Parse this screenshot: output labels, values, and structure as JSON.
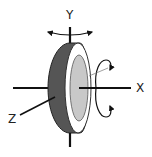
{
  "diagram": {
    "type": "3d-axes-disc-rotation",
    "labels": {
      "y_axis": "Y",
      "x_axis": "X",
      "z_axis": "Z"
    },
    "colors": {
      "background": "#ffffff",
      "line": "#111111",
      "rim": "#555555",
      "face": "#ffffff",
      "hub": "#c8c8c8",
      "text": "#222222"
    },
    "elements": [
      {
        "name": "disc",
        "description": "wheel with dark rim, white face, light gray hub"
      },
      {
        "name": "y-axis",
        "description": "vertical axis with yaw rotation arrow"
      },
      {
        "name": "x-axis",
        "description": "horizontal axis with roll rotation arrow"
      },
      {
        "name": "z-axis",
        "description": "diagonal axis toward viewer"
      }
    ]
  }
}
